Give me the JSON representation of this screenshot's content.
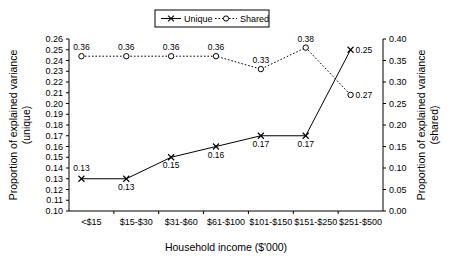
{
  "chart_data": {
    "type": "line",
    "title": "",
    "xlabel": "Household income ($'000)",
    "ylabel": "Proportion of explained variance (unique)",
    "ylabel_right": "Proportion of explained variance (shared)",
    "categories": [
      "<$15",
      "$15-$30",
      "$31-$60",
      "$61-$100",
      "$101-$150",
      "$151-$250",
      "$251-$500"
    ],
    "series": [
      {
        "name": "Unique",
        "axis": "left",
        "marker": "x",
        "line": "solid",
        "values": [
          0.13,
          0.13,
          0.15,
          0.16,
          0.17,
          0.17,
          0.25
        ],
        "labels": [
          "0.13",
          "0.13",
          "0.15",
          "0.16",
          "0.17",
          "0.17",
          "0.25"
        ]
      },
      {
        "name": "Shared",
        "axis": "right",
        "marker": "o",
        "line": "dotted",
        "values": [
          0.36,
          0.36,
          0.36,
          0.36,
          0.33,
          0.38,
          0.27
        ],
        "labels": [
          "0.36",
          "0.36",
          "0.36",
          "0.36",
          "0.33",
          "0.38",
          "0.27"
        ]
      }
    ],
    "ylim": [
      0.1,
      0.26
    ],
    "ylim_right": [
      0.0,
      0.4
    ],
    "yticks": [
      "0.10",
      "0.11",
      "0.12",
      "0.13",
      "0.14",
      "0.15",
      "0.16",
      "0.17",
      "0.18",
      "0.19",
      "0.20",
      "0.21",
      "0.22",
      "0.23",
      "0.24",
      "0.25",
      "0.26"
    ],
    "yticks_right": [
      "0.00",
      "0.05",
      "0.10",
      "0.15",
      "0.20",
      "0.25",
      "0.30",
      "0.35",
      "0.40"
    ],
    "grid": false,
    "legend_position": "top-center",
    "legend": [
      "Unique",
      "Shared"
    ]
  },
  "axis_titles": {
    "left": "Proportion of explained variance",
    "left_sub": "(unique)",
    "right": "Proportion of explained variance",
    "right_sub": "(shared)",
    "bottom": "Household income ($'000)"
  },
  "legend": {
    "unique": "Unique",
    "shared": "Shared"
  },
  "colors": {
    "line": "#000000",
    "background": "#ffffff",
    "text": "#000000"
  }
}
